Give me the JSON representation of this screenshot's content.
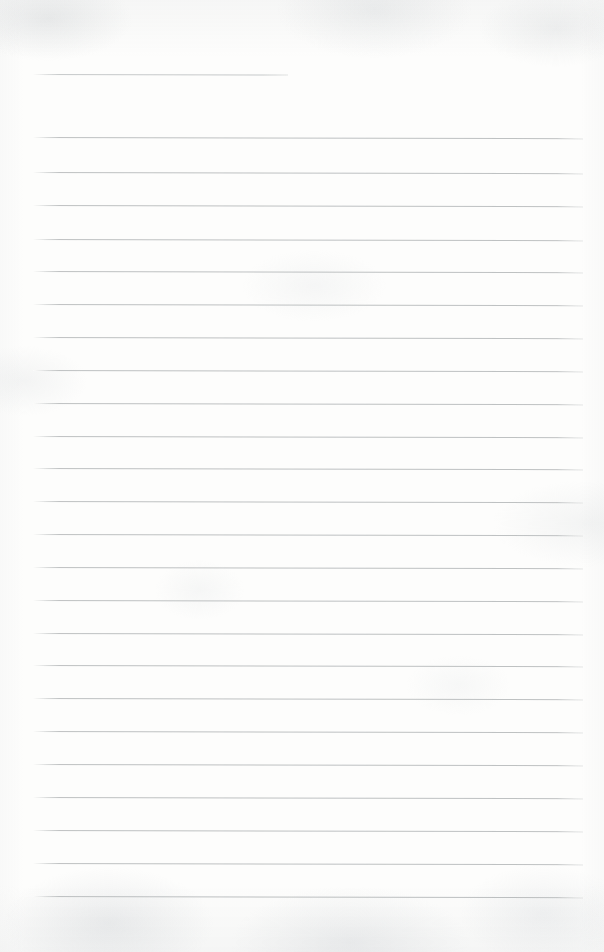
{
  "document": {
    "kind": "lined-paper",
    "label": "Blank ruled notebook page",
    "width": 604,
    "height": 952,
    "background_color": "#fdfdfc",
    "text_content": "",
    "is_blank": true
  },
  "ruling": {
    "line_color": "#b9bcbd",
    "header_line_color": "#c2c5c6",
    "line_thickness_px": 1,
    "line_spacing_px": 33,
    "left_margin_px": 33,
    "right_edge_px": 583,
    "line_count": 25,
    "header_line_right_edge_px": 288,
    "slope_deg": 0.12
  },
  "lines": [
    {
      "index": 1,
      "y": 74,
      "x": 33,
      "width": 255,
      "type": "header-rule"
    },
    {
      "index": 2,
      "y": 137,
      "x": 33,
      "width": 550,
      "type": "body-rule"
    },
    {
      "index": 3,
      "y": 172,
      "x": 33,
      "width": 550,
      "type": "body-rule"
    },
    {
      "index": 4,
      "y": 205,
      "x": 33,
      "width": 550,
      "type": "body-rule"
    },
    {
      "index": 5,
      "y": 239,
      "x": 33,
      "width": 550,
      "type": "body-rule"
    },
    {
      "index": 6,
      "y": 271,
      "x": 33,
      "width": 550,
      "type": "body-rule"
    },
    {
      "index": 7,
      "y": 304,
      "x": 33,
      "width": 550,
      "type": "body-rule"
    },
    {
      "index": 8,
      "y": 337,
      "x": 33,
      "width": 550,
      "type": "body-rule"
    },
    {
      "index": 9,
      "y": 370,
      "x": 33,
      "width": 550,
      "type": "body-rule"
    },
    {
      "index": 10,
      "y": 403,
      "x": 33,
      "width": 550,
      "type": "body-rule"
    },
    {
      "index": 11,
      "y": 436,
      "x": 33,
      "width": 550,
      "type": "body-rule"
    },
    {
      "index": 12,
      "y": 468,
      "x": 33,
      "width": 550,
      "type": "body-rule"
    },
    {
      "index": 13,
      "y": 501,
      "x": 33,
      "width": 550,
      "type": "body-rule"
    },
    {
      "index": 14,
      "y": 534,
      "x": 33,
      "width": 550,
      "type": "body-rule"
    },
    {
      "index": 15,
      "y": 567,
      "x": 33,
      "width": 550,
      "type": "body-rule"
    },
    {
      "index": 16,
      "y": 600,
      "x": 33,
      "width": 550,
      "type": "body-rule"
    },
    {
      "index": 17,
      "y": 633,
      "x": 33,
      "width": 550,
      "type": "body-rule"
    },
    {
      "index": 18,
      "y": 665,
      "x": 33,
      "width": 550,
      "type": "body-rule"
    },
    {
      "index": 19,
      "y": 698,
      "x": 33,
      "width": 550,
      "type": "body-rule"
    },
    {
      "index": 20,
      "y": 731,
      "x": 33,
      "width": 550,
      "type": "body-rule"
    },
    {
      "index": 21,
      "y": 764,
      "x": 33,
      "width": 550,
      "type": "body-rule"
    },
    {
      "index": 22,
      "y": 797,
      "x": 33,
      "width": 550,
      "type": "body-rule"
    },
    {
      "index": 23,
      "y": 830,
      "x": 33,
      "width": 550,
      "type": "body-rule"
    },
    {
      "index": 24,
      "y": 863,
      "x": 33,
      "width": 550,
      "type": "body-rule"
    },
    {
      "index": 25,
      "y": 896,
      "x": 33,
      "width": 550,
      "type": "body-rule"
    }
  ]
}
